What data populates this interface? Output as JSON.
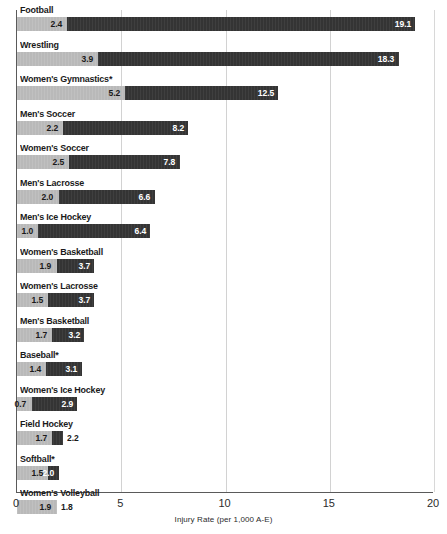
{
  "chart_data": {
    "type": "bar",
    "title": "",
    "xlabel": "Injury Rate (per 1,000 A-E)",
    "ylabel": "",
    "xlim": [
      0,
      20
    ],
    "xticks": [
      "0",
      "5",
      "10",
      "15",
      "20"
    ],
    "grid": true,
    "legend": "none",
    "orientation": "horizontal",
    "categories": [
      "Football",
      "Wrestling",
      "Women's Gymnastics*",
      "Men's Soccer",
      "Women's Soccer",
      "Men's Lacrosse",
      "Men's Ice Hockey",
      "Women's Basketball",
      "Women's Lacrosse",
      "Men's Basketball",
      "Baseball*",
      "Women's Ice Hockey",
      "Field Hockey",
      "Softball*",
      "Women's Volleyball"
    ],
    "series": [
      {
        "name": "game",
        "color": "#343434",
        "values": [
          19.1,
          18.3,
          12.5,
          8.2,
          7.8,
          6.6,
          6.4,
          3.7,
          3.7,
          3.2,
          3.1,
          2.9,
          2.2,
          2.0,
          1.8
        ]
      },
      {
        "name": "practice",
        "color": "#b9b9b9",
        "values": [
          2.4,
          3.9,
          5.2,
          2.2,
          2.5,
          2.0,
          1.0,
          1.9,
          1.5,
          1.7,
          1.4,
          0.7,
          1.7,
          1.5,
          1.9
        ]
      }
    ],
    "rows": [
      {
        "label": "Football",
        "dark": 19.1,
        "light": 2.4,
        "dark_text": "19.1",
        "light_text": "2.4",
        "dark_label_inside": true
      },
      {
        "label": "Wrestling",
        "dark": 18.3,
        "light": 3.9,
        "dark_text": "18.3",
        "light_text": "3.9",
        "dark_label_inside": true
      },
      {
        "label": "Women's Gymnastics*",
        "dark": 12.5,
        "light": 5.2,
        "dark_text": "12.5",
        "light_text": "5.2",
        "dark_label_inside": true
      },
      {
        "label": "Men's Soccer",
        "dark": 8.2,
        "light": 2.2,
        "dark_text": "8.2",
        "light_text": "2.2",
        "dark_label_inside": true
      },
      {
        "label": "Women's Soccer",
        "dark": 7.8,
        "light": 2.5,
        "dark_text": "7.8",
        "light_text": "2.5",
        "dark_label_inside": true
      },
      {
        "label": "Men's Lacrosse",
        "dark": 6.6,
        "light": 2.0,
        "dark_text": "6.6",
        "light_text": "2.0",
        "dark_label_inside": true
      },
      {
        "label": "Men's Ice Hockey",
        "dark": 6.4,
        "light": 1.0,
        "dark_text": "6.4",
        "light_text": "1.0",
        "dark_label_inside": true
      },
      {
        "label": "Women's Basketball",
        "dark": 3.7,
        "light": 1.9,
        "dark_text": "3.7",
        "light_text": "1.9",
        "dark_label_inside": true
      },
      {
        "label": "Women's Lacrosse",
        "dark": 3.7,
        "light": 1.5,
        "dark_text": "3.7",
        "light_text": "1.5",
        "dark_label_inside": true
      },
      {
        "label": "Men's Basketball",
        "dark": 3.2,
        "light": 1.7,
        "dark_text": "3.2",
        "light_text": "1.7",
        "dark_label_inside": true
      },
      {
        "label": "Baseball*",
        "dark": 3.1,
        "light": 1.4,
        "dark_text": "3.1",
        "light_text": "1.4",
        "dark_label_inside": true
      },
      {
        "label": "Women's Ice Hockey",
        "dark": 2.9,
        "light": 0.7,
        "dark_text": "2.9",
        "light_text": "0.7",
        "dark_label_inside": true
      },
      {
        "label": "Field Hockey",
        "dark": 2.2,
        "light": 1.7,
        "dark_text": "2.2",
        "light_text": "1.7",
        "dark_label_inside": false
      },
      {
        "label": "Softball*",
        "dark": 2.0,
        "light": 1.5,
        "dark_text": "2.0",
        "light_text": "1.5",
        "dark_label_inside": true
      },
      {
        "label": "Women's Volleyball",
        "dark": 1.8,
        "light": 1.9,
        "dark_text": "1.8",
        "light_text": "1.9",
        "dark_label_inside": false
      }
    ]
  }
}
